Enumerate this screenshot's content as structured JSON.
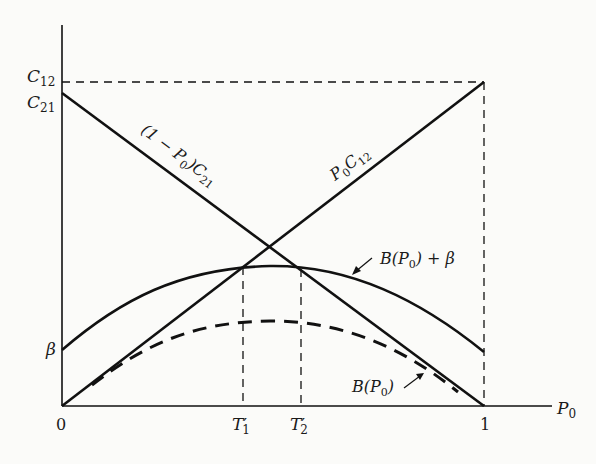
{
  "figure": {
    "type": "diagram"
  },
  "axes": {
    "x_label": "P",
    "x_label_sub": "0",
    "x_ticks": [
      "0",
      "1"
    ],
    "x_tick_T1": {
      "main": "T",
      "prime": "′",
      "sub": "1"
    },
    "x_tick_T2": {
      "main": "T",
      "prime": "′",
      "sub": "2"
    },
    "y_ticks": {
      "c12": {
        "main": "C",
        "sub": "12"
      },
      "c21": {
        "main": "C",
        "sub": "21"
      },
      "beta": "β"
    }
  },
  "curves": {
    "line_c21": {
      "pre": "(1 − P",
      "sub": "0",
      "post": ")C",
      "sub2": "21"
    },
    "line_c12": {
      "pre": "P",
      "sub": "0",
      "post": "C",
      "sub2": "12"
    },
    "b_plus_beta": {
      "pre": "B(P",
      "sub": "0",
      "post": ") + β"
    },
    "b": {
      "pre": "B(P",
      "sub": "0",
      "post": ")"
    }
  },
  "colors": {
    "ink": "#111111",
    "paper": "#fbfbf9"
  }
}
